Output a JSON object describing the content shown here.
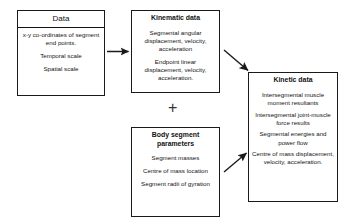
{
  "diagram": {
    "type": "flowchart",
    "boxes": [
      {
        "id": "data",
        "title": "Data",
        "title_style": "plain-with-rule",
        "entries": [
          "x-y co-ordinates of segment end points.",
          "Temporal scale",
          "Spatial scale"
        ]
      },
      {
        "id": "kinematic",
        "title": "Kinematic data",
        "title_style": "bold",
        "entries": [
          "Segmental angular displacement, velocity, acceleration",
          "Endpoint linear displacement, velocity, acceleration."
        ]
      },
      {
        "id": "body_segment",
        "title": "Body segment parameters",
        "title_style": "bold",
        "entries": [
          "Segment masses",
          "Centre of mass location",
          "Segment radii of gyration"
        ]
      },
      {
        "id": "kinetic",
        "title": "Kinetic data",
        "title_style": "bold",
        "entries": [
          "Intersegmental muscle moment resultants",
          "Intersegmental joint-muscle force results",
          "Segmental energies and power flow",
          "Centre of mass displacement, velocity, acceleration."
        ]
      }
    ],
    "operator": "+",
    "arrows": [
      {
        "id": "data-to-kinematic",
        "from": "data",
        "to": "kinematic",
        "direction": "right"
      },
      {
        "id": "kinematic-to-kinetic",
        "from": "kinematic",
        "to": "kinetic",
        "direction": "down-right"
      },
      {
        "id": "bodyseg-to-kinetic",
        "from": "body_segment",
        "to": "kinetic",
        "direction": "up-right"
      }
    ],
    "colors": {
      "stroke": "#1a1a1a",
      "text": "#141414",
      "background": "#ffffff"
    }
  }
}
